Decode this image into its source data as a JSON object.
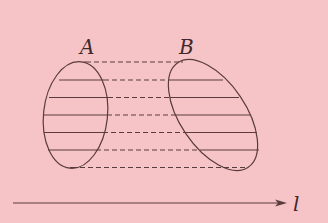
{
  "diagram": {
    "background": "#f6c4c7",
    "stroke": "#5b3c3e",
    "labels": {
      "a": "A",
      "b": "B",
      "axis": "l"
    },
    "ellipse_a": {
      "cx": 75.5,
      "cy": 115,
      "rx": 32,
      "ry": 53.5,
      "rotate": 6
    },
    "ellipse_b": {
      "cx": 213,
      "cy": 115,
      "rx": 33,
      "ry": 63,
      "rotate": -34
    },
    "levels": [
      {
        "y": 62,
        "a_left": 84,
        "a_right": 86,
        "b_left": 181,
        "b_right": 183
      },
      {
        "y": 80,
        "a_left": 59,
        "a_right": 104,
        "b_left": 169,
        "b_right": 223
      },
      {
        "y": 97.5,
        "a_left": 49,
        "a_right": 108,
        "b_left": 170,
        "b_right": 239
      },
      {
        "y": 115,
        "a_left": 44,
        "a_right": 107,
        "b_left": 176,
        "b_right": 250
      },
      {
        "y": 132.5,
        "a_left": 44,
        "a_right": 103,
        "b_left": 186,
        "b_right": 257
      },
      {
        "y": 150,
        "a_left": 48,
        "a_right": 96,
        "b_left": 200,
        "b_right": 259
      },
      {
        "y": 167.5,
        "a_left": 70,
        "a_right": 72,
        "b_left": 243,
        "b_right": 245
      }
    ],
    "axis": {
      "x1": 13,
      "x2": 287,
      "y": 203
    }
  }
}
